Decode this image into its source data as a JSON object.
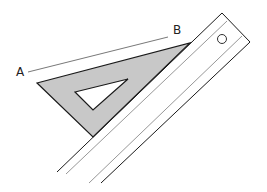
{
  "diagram": {
    "labels": {
      "point_a": "A",
      "point_b": "B"
    },
    "colors": {
      "stroke": "#1a1a1a",
      "light_stroke": "#6a6a6a",
      "triangle_fill": "#c8c8c8",
      "background": "#ffffff"
    },
    "elements": [
      {
        "name": "line-ab",
        "from": [
          28,
          72
        ],
        "to": [
          168,
          37
        ]
      },
      {
        "name": "set-square",
        "vertices": [
          [
            37,
            83
          ],
          [
            190,
            43
          ],
          [
            93,
            137
          ]
        ]
      },
      {
        "name": "set-square-cutout",
        "vertices": [
          [
            75,
            92
          ],
          [
            128,
            79
          ],
          [
            93,
            110
          ]
        ]
      },
      {
        "name": "ruler",
        "corners": [
          [
            222,
            13
          ],
          [
            250,
            42
          ],
          [
            101,
            183
          ],
          [
            57,
            172
          ]
        ]
      },
      {
        "name": "ruler-hole",
        "center": [
          222,
          39
        ],
        "radius": 4.5
      }
    ]
  }
}
